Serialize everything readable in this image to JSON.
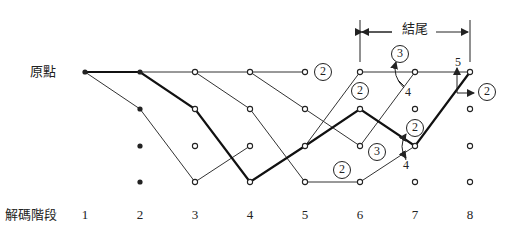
{
  "labels": {
    "origin": "原點",
    "axis_title": "解碼階段",
    "ending": "結尾"
  },
  "stages": [
    "1",
    "2",
    "3",
    "4",
    "5",
    "6",
    "7",
    "8"
  ],
  "trellis": {
    "column_x": [
      85,
      140,
      195,
      250,
      305,
      360,
      415,
      470
    ],
    "row_y": [
      72,
      109,
      146,
      182
    ],
    "solid_nodes": [
      [
        0,
        0
      ],
      [
        1,
        0
      ],
      [
        1,
        1
      ],
      [
        1,
        2
      ],
      [
        1,
        3
      ]
    ],
    "open_nodes": [
      [
        2,
        0
      ],
      [
        2,
        1
      ],
      [
        2,
        2
      ],
      [
        2,
        3
      ],
      [
        3,
        0
      ],
      [
        3,
        1
      ],
      [
        3,
        2
      ],
      [
        3,
        3
      ],
      [
        4,
        0
      ],
      [
        4,
        1
      ],
      [
        4,
        2
      ],
      [
        4,
        3
      ],
      [
        5,
        0
      ],
      [
        5,
        1
      ],
      [
        5,
        2
      ],
      [
        5,
        3
      ],
      [
        6,
        0
      ],
      [
        6,
        1
      ],
      [
        6,
        2
      ],
      [
        6,
        3
      ],
      [
        7,
        0
      ],
      [
        7,
        1
      ],
      [
        7,
        2
      ],
      [
        7,
        3
      ]
    ],
    "branches": [
      [
        0,
        0,
        1,
        1
      ],
      [
        1,
        0,
        2,
        0
      ],
      [
        1,
        1,
        2,
        3
      ],
      [
        2,
        0,
        3,
        0
      ],
      [
        2,
        0,
        3,
        1
      ],
      [
        2,
        3,
        3,
        2
      ],
      [
        3,
        0,
        4,
        0
      ],
      [
        3,
        0,
        4,
        1
      ],
      [
        3,
        1,
        4,
        3
      ],
      [
        4,
        1,
        5,
        2
      ],
      [
        4,
        2,
        5,
        0
      ],
      [
        4,
        3,
        5,
        3
      ],
      [
        5,
        0,
        6,
        0
      ],
      [
        5,
        2,
        6,
        0
      ],
      [
        5,
        3,
        6,
        2
      ],
      [
        6,
        0,
        7,
        0
      ]
    ],
    "survivor_path": [
      [
        0,
        0
      ],
      [
        1,
        0
      ],
      [
        2,
        1
      ],
      [
        3,
        3
      ],
      [
        4,
        2
      ],
      [
        5,
        1
      ],
      [
        6,
        2
      ],
      [
        7,
        0
      ]
    ],
    "colors": {
      "line": "#333333",
      "bold": "#111111",
      "node_fill": "#ffffff"
    }
  },
  "metrics": {
    "circled": [
      {
        "value": "2",
        "x": 323,
        "y": 72
      },
      {
        "value": "3",
        "x": 400,
        "y": 54
      },
      {
        "value": "2",
        "x": 360,
        "y": 91
      },
      {
        "value": "2",
        "x": 487,
        "y": 92
      },
      {
        "value": "2",
        "x": 415,
        "y": 128
      },
      {
        "value": "3",
        "x": 377,
        "y": 152
      },
      {
        "value": "2",
        "x": 342,
        "y": 170
      }
    ],
    "plain": [
      {
        "value": "4",
        "x": 408,
        "y": 92
      },
      {
        "value": "5",
        "x": 458,
        "y": 62
      },
      {
        "value": "4",
        "x": 406,
        "y": 165
      }
    ]
  },
  "ending_bracket": {
    "x_start": 360,
    "x_end": 470,
    "y": 32
  }
}
